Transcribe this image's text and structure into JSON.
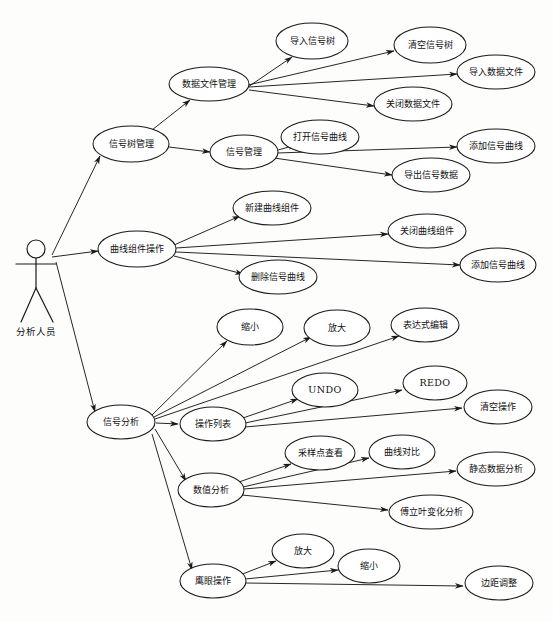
{
  "diagram": {
    "type": "uml-use-case-diagram",
    "actor": {
      "name": "分析人员",
      "x": 36,
      "y": 248
    },
    "arrow_marker": "arrowhead",
    "colors": {
      "stroke": "#1a1a1a",
      "fill": "#ffffff",
      "background": "#fdfdfc"
    },
    "nodes": [
      {
        "id": "n1",
        "label": "信号树管理",
        "cx": 131,
        "cy": 144,
        "rx": 38,
        "ry": 18
      },
      {
        "id": "n2",
        "label": "数据文件管理",
        "cx": 209,
        "cy": 84,
        "rx": 40,
        "ry": 17
      },
      {
        "id": "n3",
        "label": "导入信号树",
        "cx": 312,
        "cy": 41,
        "rx": 36,
        "ry": 18
      },
      {
        "id": "n4",
        "label": "清空信号树",
        "cx": 430,
        "cy": 45,
        "rx": 36,
        "ry": 18
      },
      {
        "id": "n5",
        "label": "导入数据文件",
        "cx": 496,
        "cy": 72,
        "rx": 39,
        "ry": 17
      },
      {
        "id": "n6",
        "label": "关闭数据文件",
        "cx": 413,
        "cy": 104,
        "rx": 39,
        "ry": 17
      },
      {
        "id": "n7",
        "label": "信号管理",
        "cx": 244,
        "cy": 152,
        "rx": 34,
        "ry": 17
      },
      {
        "id": "n8",
        "label": "打开信号曲线",
        "cx": 320,
        "cy": 137,
        "rx": 39,
        "ry": 17
      },
      {
        "id": "n9",
        "label": "添加信号曲线",
        "cx": 496,
        "cy": 146,
        "rx": 39,
        "ry": 17
      },
      {
        "id": "n10",
        "label": "导出信号数据",
        "cx": 431,
        "cy": 175,
        "rx": 39,
        "ry": 17
      },
      {
        "id": "n11",
        "label": "曲线组件操作",
        "cx": 137,
        "cy": 249,
        "rx": 39,
        "ry": 18
      },
      {
        "id": "n12",
        "label": "新建曲线组件",
        "cx": 272,
        "cy": 208,
        "rx": 39,
        "ry": 17
      },
      {
        "id": "n13",
        "label": "关闭曲线组件",
        "cx": 427,
        "cy": 231,
        "rx": 39,
        "ry": 17
      },
      {
        "id": "n14",
        "label": "添加信号曲线",
        "cx": 498,
        "cy": 265,
        "rx": 38,
        "ry": 17
      },
      {
        "id": "n15",
        "label": "删除信号曲线",
        "cx": 278,
        "cy": 277,
        "rx": 39,
        "ry": 17
      },
      {
        "id": "n16",
        "label": "信号分析",
        "cx": 121,
        "cy": 422,
        "rx": 34,
        "ry": 17
      },
      {
        "id": "n17",
        "label": "缩小",
        "cx": 250,
        "cy": 327,
        "rx": 33,
        "ry": 18
      },
      {
        "id": "n18",
        "label": "放大",
        "cx": 337,
        "cy": 328,
        "rx": 33,
        "ry": 18
      },
      {
        "id": "n19",
        "label": "表达式编辑",
        "cx": 425,
        "cy": 325,
        "rx": 34,
        "ry": 17
      },
      {
        "id": "n20",
        "label": "操作列表",
        "cx": 213,
        "cy": 424,
        "rx": 33,
        "ry": 17
      },
      {
        "id": "n21",
        "label": "UNDO",
        "cx": 325,
        "cy": 390,
        "rx": 33,
        "ry": 17,
        "latin": true
      },
      {
        "id": "n22",
        "label": "REDO",
        "cx": 435,
        "cy": 383,
        "rx": 32,
        "ry": 17,
        "latin": true
      },
      {
        "id": "n23",
        "label": "清空操作",
        "cx": 498,
        "cy": 407,
        "rx": 34,
        "ry": 17
      },
      {
        "id": "n24",
        "label": "数值分析",
        "cx": 211,
        "cy": 490,
        "rx": 33,
        "ry": 17
      },
      {
        "id": "n25",
        "label": "采样点查看",
        "cx": 320,
        "cy": 453,
        "rx": 35,
        "ry": 17
      },
      {
        "id": "n26",
        "label": "曲线对比",
        "cx": 402,
        "cy": 452,
        "rx": 33,
        "ry": 17
      },
      {
        "id": "n27",
        "label": "静态数据分析",
        "cx": 496,
        "cy": 469,
        "rx": 39,
        "ry": 17
      },
      {
        "id": "n28",
        "label": "傅立叶变化分析",
        "cx": 431,
        "cy": 512,
        "rx": 42,
        "ry": 17
      },
      {
        "id": "n29",
        "label": "鹰眼操作",
        "cx": 213,
        "cy": 581,
        "rx": 33,
        "ry": 17
      },
      {
        "id": "n30",
        "label": "放大",
        "cx": 303,
        "cy": 551,
        "rx": 31,
        "ry": 17
      },
      {
        "id": "n31",
        "label": "缩小",
        "cx": 369,
        "cy": 566,
        "rx": 31,
        "ry": 17
      },
      {
        "id": "n32",
        "label": "边距调整",
        "cx": 499,
        "cy": 583,
        "rx": 34,
        "ry": 17
      }
    ],
    "edges": [
      {
        "from": "actor",
        "to": "n1",
        "fx": 52,
        "fy": 255,
        "tx": 100,
        "ty": 156
      },
      {
        "from": "actor",
        "to": "n11",
        "fx": 52,
        "fy": 257,
        "tx": 98,
        "ty": 251
      },
      {
        "from": "actor",
        "to": "n16",
        "fx": 56,
        "fy": 262,
        "tx": 95,
        "ty": 412
      },
      {
        "from": "n1",
        "to": "n2",
        "fx": 152,
        "fy": 130,
        "tx": 190,
        "ty": 100
      },
      {
        "from": "n1",
        "to": "n7",
        "fx": 169,
        "fy": 147,
        "tx": 210,
        "ty": 152
      },
      {
        "from": "n2",
        "to": "n3",
        "fx": 248,
        "fy": 87,
        "tx": 292,
        "ty": 57
      },
      {
        "from": "n2",
        "to": "n4",
        "fx": 248,
        "fy": 85,
        "tx": 394,
        "ty": 51
      },
      {
        "from": "n2",
        "to": "n5",
        "fx": 249,
        "fy": 87,
        "tx": 457,
        "ty": 74
      },
      {
        "from": "n2",
        "to": "n6",
        "fx": 249,
        "fy": 90,
        "tx": 374,
        "ty": 106
      },
      {
        "from": "n7",
        "to": "n8",
        "fx": 271,
        "fy": 152,
        "tx": 296,
        "ty": 145
      },
      {
        "from": "n7",
        "to": "n9",
        "fx": 277,
        "fy": 153,
        "tx": 457,
        "ty": 147
      },
      {
        "from": "n7",
        "to": "n10",
        "fx": 274,
        "fy": 158,
        "tx": 392,
        "ty": 175
      },
      {
        "from": "n11",
        "to": "n12",
        "fx": 174,
        "fy": 245,
        "tx": 240,
        "ty": 216
      },
      {
        "from": "n11",
        "to": "n13",
        "fx": 176,
        "fy": 248,
        "tx": 388,
        "ty": 234
      },
      {
        "from": "n11",
        "to": "n14",
        "fx": 176,
        "fy": 252,
        "tx": 460,
        "ty": 265
      },
      {
        "from": "n11",
        "to": "n15",
        "fx": 174,
        "fy": 256,
        "tx": 243,
        "ty": 274
      },
      {
        "from": "n16",
        "to": "n17",
        "fx": 152,
        "fy": 415,
        "tx": 227,
        "ty": 341
      },
      {
        "from": "n16",
        "to": "n18",
        "fx": 154,
        "fy": 417,
        "tx": 311,
        "ty": 337
      },
      {
        "from": "n16",
        "to": "n19",
        "fx": 155,
        "fy": 419,
        "tx": 399,
        "ty": 336
      },
      {
        "from": "n16",
        "to": "n20",
        "fx": 156,
        "fy": 423,
        "tx": 178,
        "ty": 424
      },
      {
        "from": "n16",
        "to": "n24",
        "fx": 155,
        "fy": 429,
        "tx": 186,
        "ty": 481
      },
      {
        "from": "n16",
        "to": "n29",
        "fx": 152,
        "fy": 434,
        "tx": 192,
        "ty": 570
      },
      {
        "from": "n20",
        "to": "n21",
        "fx": 240,
        "fy": 419,
        "tx": 298,
        "ty": 399
      },
      {
        "from": "n20",
        "to": "n22",
        "fx": 245,
        "fy": 423,
        "tx": 402,
        "ty": 390
      },
      {
        "from": "n20",
        "to": "n23",
        "fx": 245,
        "fy": 427,
        "tx": 462,
        "ty": 408
      },
      {
        "from": "n24",
        "to": "n25",
        "fx": 236,
        "fy": 483,
        "tx": 291,
        "ty": 464
      },
      {
        "from": "n24",
        "to": "n26",
        "fx": 243,
        "fy": 487,
        "tx": 369,
        "ty": 458
      },
      {
        "from": "n24",
        "to": "n27",
        "fx": 244,
        "fy": 489,
        "tx": 456,
        "ty": 471
      },
      {
        "from": "n24",
        "to": "n28",
        "fx": 242,
        "fy": 495,
        "tx": 388,
        "ty": 510
      },
      {
        "from": "n29",
        "to": "n30",
        "fx": 240,
        "fy": 575,
        "tx": 276,
        "ty": 561
      },
      {
        "from": "n29",
        "to": "n31",
        "fx": 245,
        "fy": 579,
        "tx": 338,
        "ty": 570
      },
      {
        "from": "n29",
        "to": "n32",
        "fx": 245,
        "fy": 583,
        "tx": 463,
        "ty": 586
      }
    ]
  }
}
